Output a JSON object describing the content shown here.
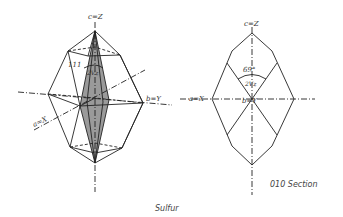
{
  "crystal": {
    "axis_c": "c=Z",
    "axis_b": "b=Y",
    "axis_a": "a=X",
    "face_label": "111",
    "angle_label": "2Vz"
  },
  "section": {
    "axis_c": "c=Z",
    "axis_b": "b=Y",
    "axis_a": "a=X",
    "angle_value": "69°",
    "angle_label": "2Vz",
    "caption": "010 Section"
  },
  "caption": "Sulfur",
  "colors": {
    "line": "#222222",
    "shade": "#9a9a9a",
    "text": "#333333"
  }
}
